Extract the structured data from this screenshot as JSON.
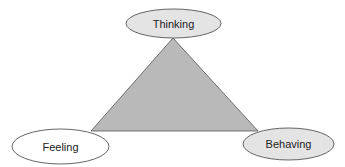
{
  "diagram": {
    "type": "triangle-cycle",
    "triangle": {
      "fill": "#b9b9b9",
      "stroke": "#555555",
      "vertices": [
        [
          173,
          38
        ],
        [
          91,
          131
        ],
        [
          258,
          131
        ]
      ]
    },
    "nodes": [
      {
        "id": "thinking",
        "label": "Thinking",
        "position": "top",
        "cx": 173.5,
        "cy": 23.5,
        "rx": 47.5,
        "ry": 14.5,
        "fill": "#e4e4e4",
        "stroke": "#555555"
      },
      {
        "id": "feeling",
        "label": "Feeling",
        "position": "bottom-left",
        "cx": 60.5,
        "cy": 146.5,
        "rx": 48.5,
        "ry": 17.5,
        "fill": "#ffffff",
        "stroke": "#555555"
      },
      {
        "id": "behaving",
        "label": "Behaving",
        "position": "bottom-right",
        "cx": 288.5,
        "cy": 144,
        "rx": 45.5,
        "ry": 16,
        "fill": "#e4e4e4",
        "stroke": "#555555"
      }
    ]
  }
}
